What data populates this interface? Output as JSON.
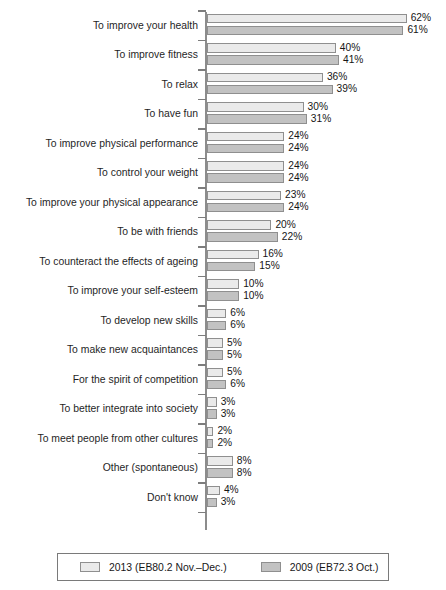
{
  "chart_data": {
    "type": "bar",
    "orientation": "horizontal",
    "title": "",
    "xlabel": "",
    "ylabel": "",
    "xlim": [
      0,
      65
    ],
    "grid": false,
    "value_suffix": "%",
    "legend_position": "bottom",
    "categories": [
      "To improve your health",
      "To improve fitness",
      "To relax",
      "To have fun",
      "To improve physical performance",
      "To control your weight",
      "To improve your physical appearance",
      "To be with friends",
      "To counteract the effects of ageing",
      "To improve your self-esteem",
      "To develop new skills",
      "To make new acquaintances",
      "For the spirit of competition",
      "To better integrate into society",
      "To meet people from other cultures",
      "Other (spontaneous)",
      "Don't know"
    ],
    "series": [
      {
        "name": "2013 (EB80.2 Nov.–Dec.)",
        "color": "#eaeaea",
        "values": [
          62,
          40,
          36,
          30,
          24,
          24,
          23,
          20,
          16,
          10,
          6,
          5,
          5,
          3,
          2,
          8,
          4
        ],
        "labels": [
          "62%",
          "40%",
          "36%",
          "30%",
          "24%",
          "24%",
          "23%",
          "20%",
          "16%",
          "10%",
          "6%",
          "5%",
          "5%",
          "3%",
          "2%",
          "8%",
          "4%"
        ]
      },
      {
        "name": "2009 (EB72.3 Oct.)",
        "color": "#c2c2c2",
        "values": [
          61,
          41,
          39,
          31,
          24,
          24,
          24,
          22,
          15,
          10,
          6,
          5,
          6,
          3,
          2,
          8,
          3
        ],
        "labels": [
          "61%",
          "41%",
          "39%",
          "31%",
          "24%",
          "24%",
          "24%",
          "22%",
          "15%",
          "10%",
          "6%",
          "5%",
          "6%",
          "3%",
          "2%",
          "8%",
          "3%"
        ]
      }
    ]
  },
  "legend": {
    "items": [
      {
        "label": "2013 (EB80.2 Nov.–Dec.)",
        "color": "#eaeaea"
      },
      {
        "label": "2009 (EB72.3 Oct.)",
        "color": "#c2c2c2"
      }
    ]
  },
  "title_remnant": ""
}
